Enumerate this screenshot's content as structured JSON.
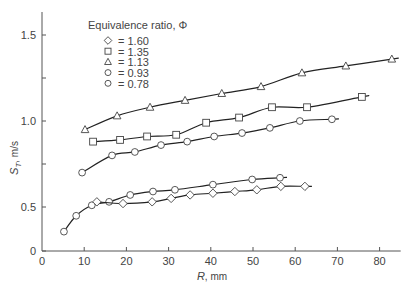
{
  "chart_data": {
    "type": "line",
    "title": "",
    "xlabel": "R, mm",
    "ylabel": "S_T, m/s",
    "xlim": [
      0,
      85
    ],
    "ylim": [
      0,
      1.6
    ],
    "x_ticks": [
      0,
      10,
      20,
      30,
      40,
      50,
      60,
      70,
      80
    ],
    "y_ticks": [
      0,
      0.5,
      1.0,
      1.5
    ],
    "y_minor_ticks": [
      0.75,
      1.25
    ],
    "grid": false,
    "legend": {
      "title": "Equivalence ratio, Φ",
      "position": "upper-left-inside",
      "entries": [
        {
          "marker": "diamond",
          "label": "= 1.60"
        },
        {
          "marker": "square",
          "label": "= 1.35"
        },
        {
          "marker": "triangle",
          "label": "= 1.13"
        },
        {
          "marker": "circle",
          "label": "= 0.93"
        },
        {
          "marker": "circle",
          "label": "= 0.78"
        }
      ]
    },
    "series": [
      {
        "name": "Φ = 1.13",
        "marker": "triangle",
        "x": [
          10.2,
          17.8,
          25.6,
          33.9,
          42.6,
          51.9,
          61.6,
          72.0,
          82.9
        ],
        "y": [
          0.95,
          1.03,
          1.08,
          1.12,
          1.16,
          1.2,
          1.28,
          1.32,
          1.36
        ]
      },
      {
        "name": "Φ = 1.35",
        "marker": "square",
        "x": [
          12.1,
          18.5,
          24.9,
          31.8,
          38.9,
          46.7,
          54.5,
          62.8,
          75.8
        ],
        "y": [
          0.88,
          0.89,
          0.91,
          0.92,
          0.99,
          1.02,
          1.08,
          1.08,
          1.14
        ]
      },
      {
        "name": "Φ = 0.93",
        "marker": "circle",
        "x": [
          9.5,
          16.6,
          22.0,
          28.2,
          34.4,
          40.8,
          47.4,
          54.0,
          61.1,
          68.7
        ],
        "y": [
          0.7,
          0.8,
          0.82,
          0.86,
          0.88,
          0.91,
          0.93,
          0.96,
          1.0,
          1.01
        ]
      },
      {
        "name": "Φ = 0.78",
        "marker": "circle",
        "x": [
          5.2,
          8.1,
          11.8,
          15.9,
          20.9,
          26.3,
          31.5,
          40.5,
          49.8,
          56.4
        ],
        "y": [
          0.22,
          0.4,
          0.51,
          0.53,
          0.57,
          0.59,
          0.6,
          0.63,
          0.66,
          0.67
        ]
      },
      {
        "name": "Φ = 1.60",
        "marker": "diamond",
        "x": [
          13.0,
          19.2,
          26.1,
          30.6,
          35.1,
          40.5,
          45.7,
          50.9,
          56.6,
          62.3
        ],
        "y": [
          0.53,
          0.52,
          0.53,
          0.55,
          0.57,
          0.58,
          0.59,
          0.6,
          0.62,
          0.62
        ]
      }
    ]
  },
  "labels": {
    "xlabel_italic": "R",
    "xlabel_rest": ", mm",
    "ylabel_main": "S",
    "ylabel_sub": "T",
    "ylabel_rest": ", m/s"
  }
}
